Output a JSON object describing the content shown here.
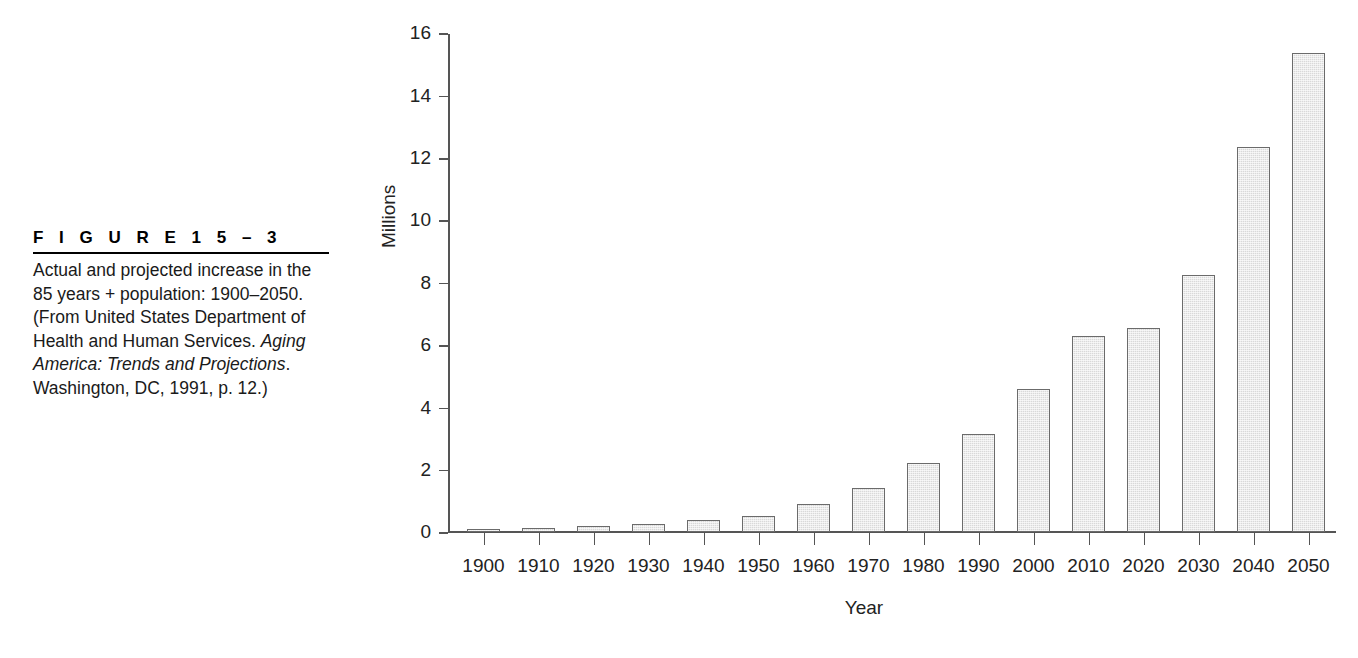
{
  "figure": {
    "heading": "F I G U R E   1 5 – 3",
    "caption_parts": {
      "p1": "Actual and projected increase in the 85 years + population: 1900–2050. (From United States Department of Health and Human Services. ",
      "p2_italic": "Aging America: Trends and Projections",
      "p3": ". Washington, DC, 1991, p. 12.)"
    }
  },
  "chart_data": {
    "type": "bar",
    "title": "",
    "subtitle": "",
    "xlabel": "Year",
    "ylabel": "Millions",
    "categories": [
      "1900",
      "1910",
      "1920",
      "1930",
      "1940",
      "1950",
      "1960",
      "1970",
      "1980",
      "1990",
      "2000",
      "2010",
      "2020",
      "2030",
      "2040",
      "2050"
    ],
    "values": [
      0.1,
      0.13,
      0.18,
      0.27,
      0.37,
      0.5,
      0.9,
      1.4,
      2.2,
      3.15,
      4.6,
      6.3,
      6.55,
      8.25,
      12.35,
      15.35
    ],
    "ylim": [
      0,
      16
    ],
    "y_ticks": [
      "0",
      "2",
      "4",
      "6",
      "8",
      "10",
      "12",
      "14",
      "16"
    ],
    "y_tick_values": [
      0,
      2,
      4,
      6,
      8,
      10,
      12,
      14,
      16
    ],
    "grid": false,
    "legend": false,
    "legend_position": "none",
    "bar_fill_color": "#d9d9d9",
    "bar_border_color": "#6b6b6b",
    "axis_color": "#555555",
    "text_color": "#222222"
  }
}
